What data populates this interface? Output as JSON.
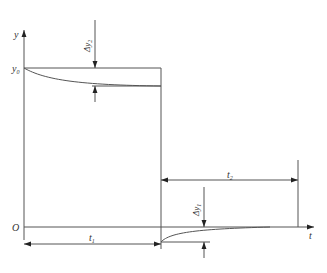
{
  "diagram": {
    "type": "step-response-timing-diagram",
    "axes": {
      "y_label": "y",
      "x_label": "t",
      "origin_label": "O",
      "y0_label": "y",
      "y0_sub": "0"
    },
    "dimensions": {
      "t1": {
        "label": "t",
        "sub": "1"
      },
      "t2": {
        "label": "t",
        "sub": "2"
      },
      "dy1": {
        "label": "Δy",
        "sub": "1"
      },
      "dy2": {
        "label": "Δy",
        "sub": "2"
      }
    },
    "colors": {
      "line": "#555555",
      "text": "#333333",
      "background": "#ffffff"
    }
  }
}
